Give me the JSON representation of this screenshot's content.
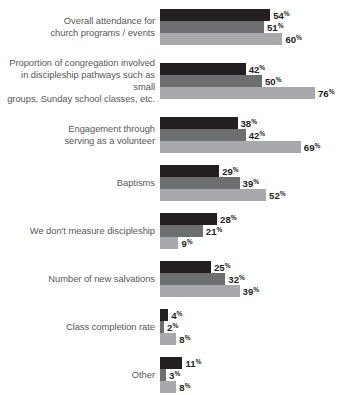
{
  "chart_data": {
    "type": "bar",
    "orientation": "horizontal",
    "title": "",
    "subtitle": "",
    "xlabel": "",
    "ylabel": "",
    "grid": false,
    "legend": "none",
    "value_suffix": "%",
    "xlim": [
      0,
      80
    ],
    "series": [
      {
        "name": "series-1",
        "color": "#231f20"
      },
      {
        "name": "series-2",
        "color": "#6d6e70"
      },
      {
        "name": "series-3",
        "color": "#a8a9ad"
      }
    ],
    "categories": [
      "Overall attendance for church programs / events",
      "Proportion of congregation involved in discipleship pathways such as small groups, Sunday school classes, etc.",
      "Engagement through serving as a volunteer",
      "Baptisms",
      "We don't measure discipleship",
      "Number of new salvations",
      "Class completion rate",
      "Other"
    ],
    "groups": [
      {
        "label_lines": [
          "Overall attendance for",
          "church programs / events"
        ],
        "values": [
          54,
          51,
          60
        ],
        "value_labels": [
          "54",
          "51",
          "60"
        ]
      },
      {
        "label_lines": [
          "Proportion of congregation involved",
          "in discipleship pathways such as small",
          "groups, Sunday school classes, etc."
        ],
        "values": [
          42,
          50,
          76
        ],
        "value_labels": [
          "42",
          "50",
          "76"
        ]
      },
      {
        "label_lines": [
          "Engagement through",
          "serving as a volunteer"
        ],
        "values": [
          38,
          42,
          69
        ],
        "value_labels": [
          "38",
          "42",
          "69"
        ]
      },
      {
        "label_lines": [
          "Baptisms"
        ],
        "values": [
          29,
          39,
          52
        ],
        "value_labels": [
          "29",
          "39",
          "52"
        ]
      },
      {
        "label_lines": [
          "We don't measure discipleship"
        ],
        "values": [
          28,
          21,
          9
        ],
        "value_labels": [
          "28",
          "21",
          "9"
        ]
      },
      {
        "label_lines": [
          "Number of new salvations"
        ],
        "values": [
          25,
          32,
          39
        ],
        "value_labels": [
          "25",
          "32",
          "39"
        ]
      },
      {
        "label_lines": [
          "Class completion rate"
        ],
        "values": [
          4,
          2,
          8
        ],
        "value_labels": [
          "4",
          "2",
          "8"
        ]
      },
      {
        "label_lines": [
          "Other"
        ],
        "values": [
          11,
          3,
          8
        ],
        "value_labels": [
          "11",
          "3",
          "8"
        ]
      }
    ]
  },
  "layout": {
    "px_per_percent": 2.04,
    "bar_height_px": 12,
    "group_gap_px": 12,
    "label_column_width_px": 160
  }
}
